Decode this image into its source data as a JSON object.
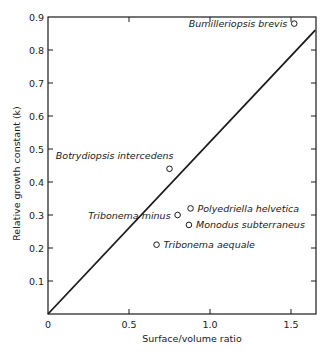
{
  "chart_data": {
    "type": "scatter",
    "title": "",
    "xlabel": "Surface/volume ratio",
    "ylabel": "Relative growth constant (k)",
    "xlim": [
      0,
      1.65
    ],
    "ylim": [
      0,
      0.9
    ],
    "grid": false,
    "legend": "none",
    "x_ticks": [
      {
        "value": 0,
        "label": "0"
      },
      {
        "value": 0.5,
        "label": "0.5"
      },
      {
        "value": 1.0,
        "label": "1.0"
      },
      {
        "value": 1.5,
        "label": "1.5"
      }
    ],
    "y_ticks": [
      {
        "value": 0.1,
        "label": "0.1"
      },
      {
        "value": 0.2,
        "label": "0.2"
      },
      {
        "value": 0.3,
        "label": "0.3"
      },
      {
        "value": 0.4,
        "label": "0.4"
      },
      {
        "value": 0.5,
        "label": "0.5"
      },
      {
        "value": 0.6,
        "label": "0.6"
      },
      {
        "value": 0.7,
        "label": "0.7"
      },
      {
        "value": 0.8,
        "label": "0.8"
      },
      {
        "value": 0.9,
        "label": "0.9"
      }
    ],
    "points": [
      {
        "name": "Bumilleriopsis brevis",
        "x": 1.52,
        "y": 0.88,
        "label_side": "left"
      },
      {
        "name": "Botrydiopsis intercedens",
        "x": 0.75,
        "y": 0.44,
        "label_side": "above-left"
      },
      {
        "name": "Tribonema minus",
        "x": 0.8,
        "y": 0.3,
        "label_side": "left"
      },
      {
        "name": "Polyedriella helvetica",
        "x": 0.88,
        "y": 0.32,
        "label_side": "right"
      },
      {
        "name": "Monodus subterraneus",
        "x": 0.87,
        "y": 0.27,
        "label_side": "right"
      },
      {
        "name": "Tribonema aequale",
        "x": 0.67,
        "y": 0.21,
        "label_side": "right"
      }
    ],
    "fit_line": {
      "x0": 0,
      "y0": 0,
      "x1": 1.65,
      "y1": 0.86,
      "slope": 0.52
    }
  },
  "layout": {
    "plot_left": 48,
    "plot_right": 316,
    "plot_top": 17,
    "plot_bottom": 314,
    "x_px_per_unit": 162,
    "y_px_per_unit": 330,
    "ink_color": "#1a1a1a"
  }
}
